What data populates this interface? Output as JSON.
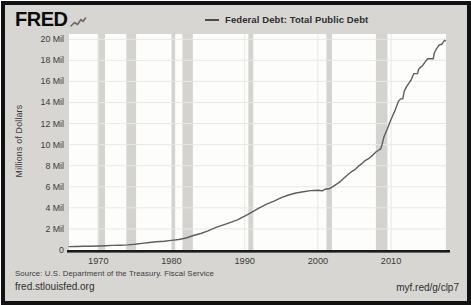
{
  "header": {
    "logo_text": "FRED",
    "legend": {
      "label": "Federal Debt: Total Public Debt"
    }
  },
  "chart_data": {
    "type": "line",
    "title": "Federal Debt: Total Public Debt",
    "xlabel": "",
    "ylabel": "Millions of Dollars",
    "unit_note": "Axis ticks 'Mil' = millions of millions of dollars ($ trillions); series values below are in the same Mil units",
    "x_range": [
      1966,
      2017.5
    ],
    "y_range": [
      0,
      20.5
    ],
    "grid": true,
    "legend_position": "top-center",
    "y_ticks": [
      {
        "v": 0,
        "label": "0"
      },
      {
        "v": 2,
        "label": "2 Mil"
      },
      {
        "v": 4,
        "label": "4 Mil"
      },
      {
        "v": 6,
        "label": "6 Mil"
      },
      {
        "v": 8,
        "label": "8 Mil"
      },
      {
        "v": 10,
        "label": "10 Mil"
      },
      {
        "v": 12,
        "label": "12 Mil"
      },
      {
        "v": 14,
        "label": "14 Mil"
      },
      {
        "v": 16,
        "label": "16 Mil"
      },
      {
        "v": 18,
        "label": "18 Mil"
      },
      {
        "v": 20,
        "label": "20 Mil"
      }
    ],
    "x_ticks": [
      {
        "v": 1970,
        "label": "1970"
      },
      {
        "v": 1980,
        "label": "1980"
      },
      {
        "v": 1990,
        "label": "1990"
      },
      {
        "v": 2000,
        "label": "2000"
      },
      {
        "v": 2010,
        "label": "2010"
      }
    ],
    "recession_bands": [
      [
        1969.92,
        1970.92
      ],
      [
        1973.83,
        1975.17
      ],
      [
        1980.0,
        1980.5
      ],
      [
        1981.5,
        1982.92
      ],
      [
        1990.5,
        1991.17
      ],
      [
        2001.17,
        2001.92
      ],
      [
        2007.92,
        2009.5
      ]
    ],
    "series": [
      {
        "name": "Federal Debt: Total Public Debt",
        "points": [
          [
            1966,
            0.32
          ],
          [
            1967,
            0.33
          ],
          [
            1968,
            0.35
          ],
          [
            1969,
            0.36
          ],
          [
            1970,
            0.38
          ],
          [
            1971,
            0.41
          ],
          [
            1972,
            0.44
          ],
          [
            1973,
            0.46
          ],
          [
            1974,
            0.48
          ],
          [
            1975,
            0.54
          ],
          [
            1976,
            0.63
          ],
          [
            1977,
            0.71
          ],
          [
            1978,
            0.78
          ],
          [
            1979,
            0.83
          ],
          [
            1980,
            0.91
          ],
          [
            1981,
            1.0
          ],
          [
            1982,
            1.14
          ],
          [
            1983,
            1.38
          ],
          [
            1984,
            1.57
          ],
          [
            1985,
            1.82
          ],
          [
            1986,
            2.12
          ],
          [
            1987,
            2.35
          ],
          [
            1988,
            2.6
          ],
          [
            1989,
            2.86
          ],
          [
            1990,
            3.21
          ],
          [
            1991,
            3.6
          ],
          [
            1992,
            4.0
          ],
          [
            1993,
            4.35
          ],
          [
            1994,
            4.64
          ],
          [
            1995,
            4.97
          ],
          [
            1996,
            5.22
          ],
          [
            1997,
            5.41
          ],
          [
            1998,
            5.53
          ],
          [
            1999,
            5.64
          ],
          [
            2000,
            5.67
          ],
          [
            2000.6,
            5.62
          ],
          [
            2001,
            5.77
          ],
          [
            2001.5,
            5.81
          ],
          [
            2002,
            6.0
          ],
          [
            2002.5,
            6.23
          ],
          [
            2003,
            6.46
          ],
          [
            2003.5,
            6.78
          ],
          [
            2004,
            7.1
          ],
          [
            2004.5,
            7.38
          ],
          [
            2005,
            7.6
          ],
          [
            2005.5,
            7.93
          ],
          [
            2006,
            8.2
          ],
          [
            2006.5,
            8.51
          ],
          [
            2007,
            8.7
          ],
          [
            2007.5,
            9.01
          ],
          [
            2008,
            9.35
          ],
          [
            2008.6,
            9.6
          ],
          [
            2008.8,
            10.1
          ],
          [
            2009,
            10.7
          ],
          [
            2009.5,
            11.5
          ],
          [
            2010,
            12.4
          ],
          [
            2010.5,
            13.2
          ],
          [
            2011,
            14.1
          ],
          [
            2011.3,
            14.34
          ],
          [
            2011.6,
            14.34
          ],
          [
            2011.8,
            15.1
          ],
          [
            2012.2,
            15.6
          ],
          [
            2012.7,
            16.1
          ],
          [
            2013.1,
            16.74
          ],
          [
            2013.6,
            16.74
          ],
          [
            2013.8,
            17.2
          ],
          [
            2014.3,
            17.5
          ],
          [
            2014.7,
            17.9
          ],
          [
            2015,
            18.15
          ],
          [
            2015.75,
            18.15
          ],
          [
            2015.9,
            18.7
          ],
          [
            2016.2,
            19.1
          ],
          [
            2016.5,
            19.4
          ],
          [
            2016.7,
            19.5
          ],
          [
            2016.9,
            19.5
          ],
          [
            2017.1,
            19.7
          ],
          [
            2017.3,
            19.9
          ],
          [
            2017.45,
            19.85
          ]
        ]
      }
    ]
  },
  "footer": {
    "source": "Source: U.S. Department of the Treasury. Fiscal Service",
    "site": "fred.stlouisfed.org",
    "short_url": "myf.red/g/clp7"
  },
  "colors": {
    "background": "#d7d6d2",
    "plot_bg": "#fdfdfc",
    "grid": "#e7e7e3",
    "recession": "#d4d3d0",
    "axis": "#1a1a1a",
    "text": "#3b3b3b",
    "line": "#5e5e60",
    "border": "#121212"
  }
}
